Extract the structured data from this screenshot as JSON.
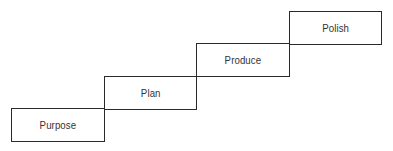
{
  "diagram": {
    "type": "staircase",
    "steps": [
      {
        "label": "Purpose",
        "x": 11,
        "y": 108,
        "w": 94,
        "h": 34
      },
      {
        "label": "Plan",
        "x": 104,
        "y": 76,
        "w": 93,
        "h": 34
      },
      {
        "label": "Produce",
        "x": 196,
        "y": 43,
        "w": 94,
        "h": 34
      },
      {
        "label": "Polish",
        "x": 289,
        "y": 11,
        "w": 93,
        "h": 34
      }
    ],
    "line_color": "#2a2a2a",
    "text_color": "#333333"
  }
}
